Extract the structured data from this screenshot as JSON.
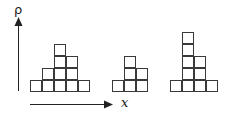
{
  "diagram": {
    "y_axis_label": "ρ",
    "x_axis_label": "x",
    "cell_size": 12,
    "base_y": 80,
    "groups": [
      {
        "name": "left",
        "origin_x": 30,
        "columns": [
          1,
          2,
          4,
          3,
          1
        ]
      },
      {
        "name": "middle",
        "origin_x": 112,
        "columns": [
          1,
          3,
          2
        ]
      },
      {
        "name": "right",
        "origin_x": 170,
        "columns": [
          1,
          5,
          3,
          1
        ]
      }
    ],
    "colors": {
      "stroke": "#3a3a3a",
      "axis": "#222222",
      "fill": "#ffffff"
    }
  }
}
